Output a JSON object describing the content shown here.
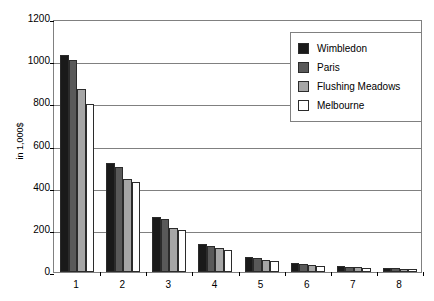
{
  "chart_data": {
    "type": "bar",
    "title": "",
    "xlabel": "",
    "ylabel": "in 1,000$",
    "ylim": [
      0,
      1200
    ],
    "ytick_labels": [
      "1200",
      "1000",
      "800",
      "600",
      "400",
      "200",
      "0"
    ],
    "ytick_values": [
      1200,
      1000,
      800,
      600,
      400,
      200,
      0
    ],
    "grid": true,
    "legend_position": "top-right",
    "categories": [
      "1",
      "2",
      "3",
      "4",
      "5",
      "6",
      "7",
      "8"
    ],
    "series": [
      {
        "name": "Wimbledon",
        "color": "#1a1a1a",
        "values": [
          1030,
          515,
          260,
          135,
          70,
          42,
          30,
          20
        ]
      },
      {
        "name": "Paris",
        "color": "#595959",
        "values": [
          1005,
          500,
          250,
          125,
          65,
          38,
          26,
          17
        ]
      },
      {
        "name": "Flushing Meadows",
        "color": "#a6a6a6",
        "values": [
          870,
          440,
          210,
          112,
          57,
          33,
          22,
          14
        ]
      },
      {
        "name": "Melbourne",
        "color": "#ffffff",
        "values": [
          795,
          425,
          200,
          105,
          52,
          30,
          20,
          12
        ]
      }
    ]
  }
}
